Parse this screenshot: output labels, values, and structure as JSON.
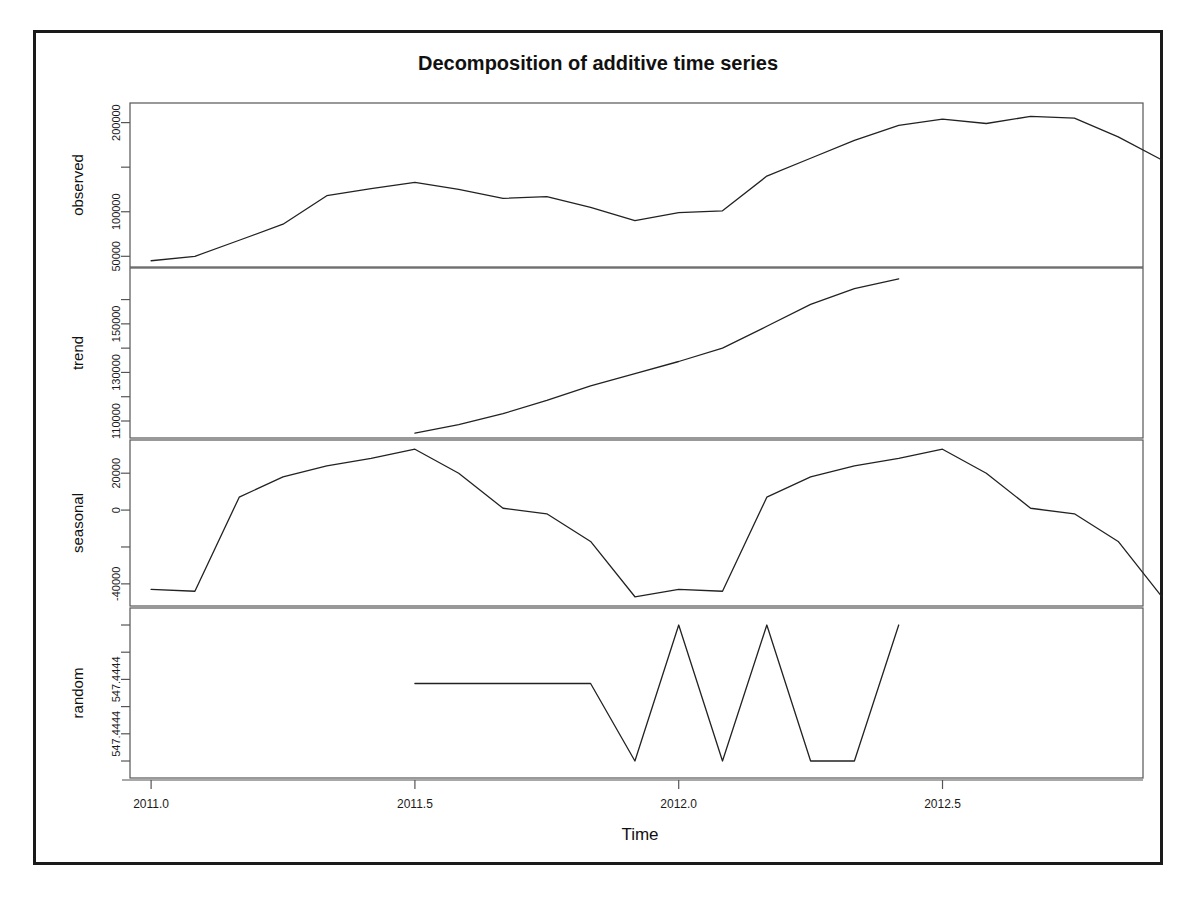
{
  "figure": {
    "title": "Decomposition of additive time series",
    "xlabel": "Time",
    "background": "#ffffff",
    "line_color": "#222222",
    "frame_color": "#1a1a1a"
  },
  "chart_data": {
    "type": "line",
    "title": "Decomposition of additive time series",
    "xlabel": "Time",
    "ylabel": "",
    "grid": false,
    "legend": "none",
    "xlim": [
      2010.96,
      2012.88
    ],
    "xticks": [
      2011.0,
      2011.5,
      2012.0,
      2012.5
    ],
    "xtick_labels": [
      "2011.0",
      "2011.5",
      "2012.0",
      "2012.5"
    ],
    "panels": [
      {
        "name": "observed",
        "label": "observed",
        "ylim": [
          38000,
          222000
        ],
        "yticks": [
          50000,
          100000,
          150000,
          200000
        ],
        "ytick_labels": [
          "50000",
          "100000",
          "",
          "200000"
        ],
        "x": [
          2011.0,
          2011.083,
          2011.167,
          2011.25,
          2011.333,
          2011.417,
          2011.5,
          2011.583,
          2011.667,
          2011.75,
          2011.833,
          2011.917,
          2012.0,
          2012.083,
          2012.167,
          2012.25,
          2012.333,
          2012.417,
          2012.5,
          2012.583,
          2012.667,
          2012.75,
          2012.833
        ],
        "values": [
          45000,
          50000,
          68000,
          86000,
          118000,
          126000,
          133000,
          125000,
          115000,
          117000,
          105000,
          90000,
          99000,
          101000,
          140000,
          160000,
          180000,
          197000,
          204000,
          199000,
          207000,
          205000,
          184000
        ],
        "values_tail": [
          158000
        ]
      },
      {
        "name": "trend",
        "label": "trend",
        "ylim": [
          103000,
          173000
        ],
        "yticks": [
          110000,
          120000,
          130000,
          140000,
          150000,
          160000
        ],
        "ytick_labels": [
          "110000",
          "",
          "130000",
          "",
          "150000",
          ""
        ],
        "x": [
          2011.5,
          2011.583,
          2011.667,
          2011.75,
          2011.833,
          2011.917,
          2012.0,
          2012.083,
          2012.167,
          2012.25,
          2012.333,
          2012.417
        ],
        "values": [
          105000,
          108500,
          113000,
          118500,
          124500,
          129500,
          134500,
          140000,
          149000,
          158000,
          164500,
          168500
        ]
      },
      {
        "name": "seasonal",
        "label": "seasonal",
        "ylim": [
          -52000,
          38000
        ],
        "yticks": [
          -40000,
          -20000,
          0,
          20000
        ],
        "ytick_labels": [
          "-40000",
          "",
          "0",
          "20000"
        ],
        "x": [
          2011.0,
          2011.083,
          2011.167,
          2011.25,
          2011.333,
          2011.417,
          2011.5,
          2011.583,
          2011.667,
          2011.75,
          2011.833,
          2011.917,
          2012.0,
          2012.083,
          2012.167,
          2012.25,
          2012.333,
          2012.417,
          2012.5,
          2012.583,
          2012.667,
          2012.75,
          2012.833
        ],
        "values": [
          -43000,
          -44000,
          7000,
          18000,
          24000,
          28000,
          33000,
          20000,
          1000,
          -2000,
          -17000,
          -47000,
          -43000,
          -44000,
          7000,
          18000,
          24000,
          28000,
          33000,
          20000,
          1000,
          -2000,
          -17000
        ],
        "values_tail": [
          -47000
        ]
      },
      {
        "name": "random",
        "label": "random",
        "ylim": [
          -1.25,
          1.25
        ],
        "yticks": [
          1.0,
          0.6,
          0.2,
          -0.2,
          -0.6,
          -1.0
        ],
        "ytick_labels": [
          "",
          "",
          "547.4444",
          "",
          "547.4444",
          ""
        ],
        "x": [
          2011.5,
          2011.583,
          2011.667,
          2011.75,
          2011.833,
          2011.917,
          2012.0,
          2012.083,
          2012.167,
          2012.25,
          2012.333,
          2012.417
        ],
        "values": [
          0.14,
          0.14,
          0.14,
          0.14,
          0.14,
          -1.0,
          1.0,
          -1.0,
          1.0,
          -1.0,
          -1.0,
          1.0
        ]
      }
    ]
  }
}
